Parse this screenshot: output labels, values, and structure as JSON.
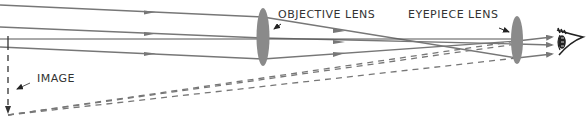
{
  "labels": {
    "objective": "OBJECTIVE LENS",
    "eyepiece": "EYEPIECE LENS",
    "image": "IMAGE"
  },
  "colors": {
    "ray": "#777777",
    "lens": "#8a8a8a",
    "text": "#333333",
    "eye": "#222222"
  }
}
